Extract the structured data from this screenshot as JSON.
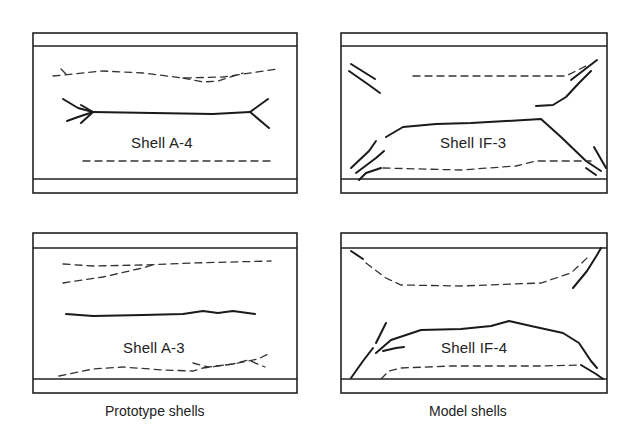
{
  "figure": {
    "panels": [
      {
        "id": "a4",
        "label": "Shell A-4",
        "group": "prototype"
      },
      {
        "id": "if3",
        "label": "Shell IF-3",
        "group": "model"
      },
      {
        "id": "a3",
        "label": "Shell A-3",
        "group": "prototype"
      },
      {
        "id": "if4",
        "label": "Shell IF-4",
        "group": "model"
      }
    ],
    "captions": {
      "prototype": "Prototype shells",
      "model": "Model shells"
    },
    "legend_semantics": {
      "solid_line": "crack (visible)",
      "dashed_line": "crack (hidden / opposite face)"
    }
  }
}
